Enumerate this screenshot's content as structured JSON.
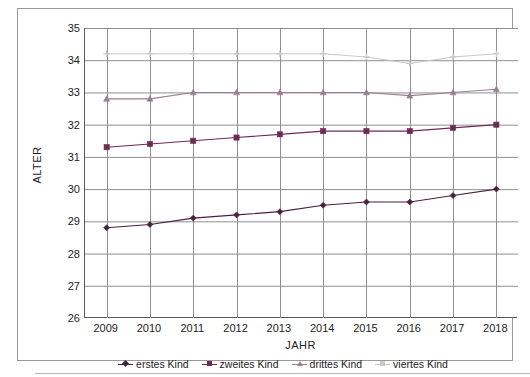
{
  "chart_data": {
    "type": "line",
    "title": "",
    "xlabel": "JAHR",
    "ylabel": "ALTER",
    "x": [
      2009,
      2010,
      2011,
      2012,
      2013,
      2014,
      2015,
      2016,
      2017,
      2018
    ],
    "categories": [
      "2009",
      "2010",
      "2011",
      "2012",
      "2013",
      "2014",
      "2015",
      "2016",
      "2017",
      "2018"
    ],
    "ylim": [
      26,
      35
    ],
    "yticks": [
      26,
      27,
      28,
      29,
      30,
      31,
      32,
      33,
      34,
      35
    ],
    "ytick_labels": [
      "26",
      "27",
      "28",
      "29",
      "30",
      "31",
      "32",
      "33",
      "34",
      "35"
    ],
    "grid": true,
    "legend_position": "bottom",
    "series": [
      {
        "name": "erstes Kind",
        "color": "#4a2040",
        "marker": "diamond",
        "values": [
          28.8,
          28.9,
          29.1,
          29.2,
          29.3,
          29.5,
          29.6,
          29.6,
          29.8,
          30.0
        ]
      },
      {
        "name": "zweites Kind",
        "color": "#6e2a55",
        "marker": "square",
        "values": [
          31.3,
          31.4,
          31.5,
          31.6,
          31.7,
          31.8,
          31.8,
          31.8,
          31.9,
          32.0
        ]
      },
      {
        "name": "drittes Kind",
        "color": "#9a7c93",
        "marker": "triangle",
        "values": [
          32.8,
          32.8,
          33.0,
          33.0,
          33.0,
          33.0,
          33.0,
          32.9,
          33.0,
          33.1
        ]
      },
      {
        "name": "viertes Kind",
        "color": "#c9c9c9",
        "marker": "cross",
        "values": [
          34.2,
          34.2,
          34.2,
          34.2,
          34.2,
          34.2,
          34.1,
          33.9,
          34.1,
          34.2
        ]
      }
    ]
  },
  "legend": {
    "items": [
      {
        "label": "erstes Kind"
      },
      {
        "label": "zweites Kind"
      },
      {
        "label": "drittes Kind"
      },
      {
        "label": "viertes Kind"
      }
    ]
  },
  "colors": {
    "grid": "#8f8f8f",
    "axis": "#5a5a5a",
    "frame": "#9a9a9a",
    "text": "#1c1c1c",
    "background": "#ffffff"
  }
}
